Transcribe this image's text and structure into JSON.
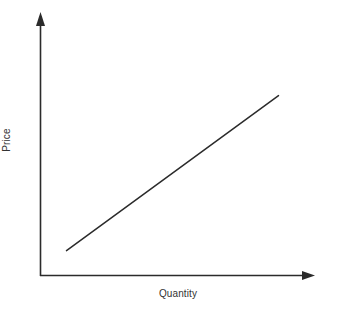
{
  "chart_data": {
    "type": "line",
    "title": "",
    "subtitle": "",
    "xlabel": "Quantity",
    "ylabel": "Price",
    "xlim": [
      0,
      1
    ],
    "ylim": [
      0,
      1
    ],
    "grid": false,
    "legend": null,
    "legend_position": "none",
    "axes": {
      "x_axis_arrow": true,
      "y_axis_arrow": true,
      "x_tick_labels": [],
      "y_tick_labels": [],
      "origin_label": ""
    },
    "series": [
      {
        "name": "Supply",
        "type": "line",
        "color": "#2b2b2b",
        "x": [
          0.1,
          0.9
        ],
        "y": [
          0.1,
          0.71
        ],
        "annotation": ""
      }
    ],
    "annotations": []
  },
  "figure": {
    "background_color": "#ffffff",
    "line_color": "#2b2b2b",
    "text_color": "#333333"
  }
}
